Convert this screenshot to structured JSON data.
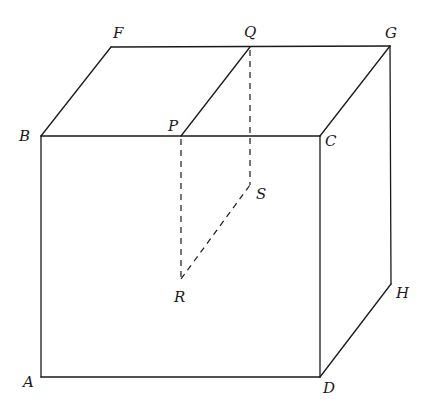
{
  "diagram": {
    "type": "cuboid-with-cross-section",
    "vertices": {
      "A": {
        "label": "A",
        "x": 41,
        "y": 377
      },
      "B": {
        "label": "B",
        "x": 41,
        "y": 136
      },
      "C": {
        "label": "C",
        "x": 320,
        "y": 136
      },
      "D": {
        "label": "D",
        "x": 320,
        "y": 377
      },
      "F": {
        "label": "F",
        "x": 111,
        "y": 47
      },
      "G": {
        "label": "G",
        "x": 390,
        "y": 46
      },
      "H": {
        "label": "H",
        "x": 391,
        "y": 284
      },
      "P": {
        "label": "P",
        "x": 181,
        "y": 136
      },
      "Q": {
        "label": "Q",
        "x": 250,
        "y": 47
      },
      "R": {
        "label": "R",
        "x": 181,
        "y": 279
      },
      "S": {
        "label": "S",
        "x": 250,
        "y": 185
      }
    },
    "solid_edges": [
      "AB",
      "BC",
      "CD",
      "DA",
      "BF",
      "FG",
      "GC",
      "GH",
      "HD",
      "PQ"
    ],
    "dashed_edges": [
      "PR",
      "QS",
      "RS"
    ],
    "colors": {
      "line": "#1a1a1a",
      "background": "#ffffff"
    }
  }
}
